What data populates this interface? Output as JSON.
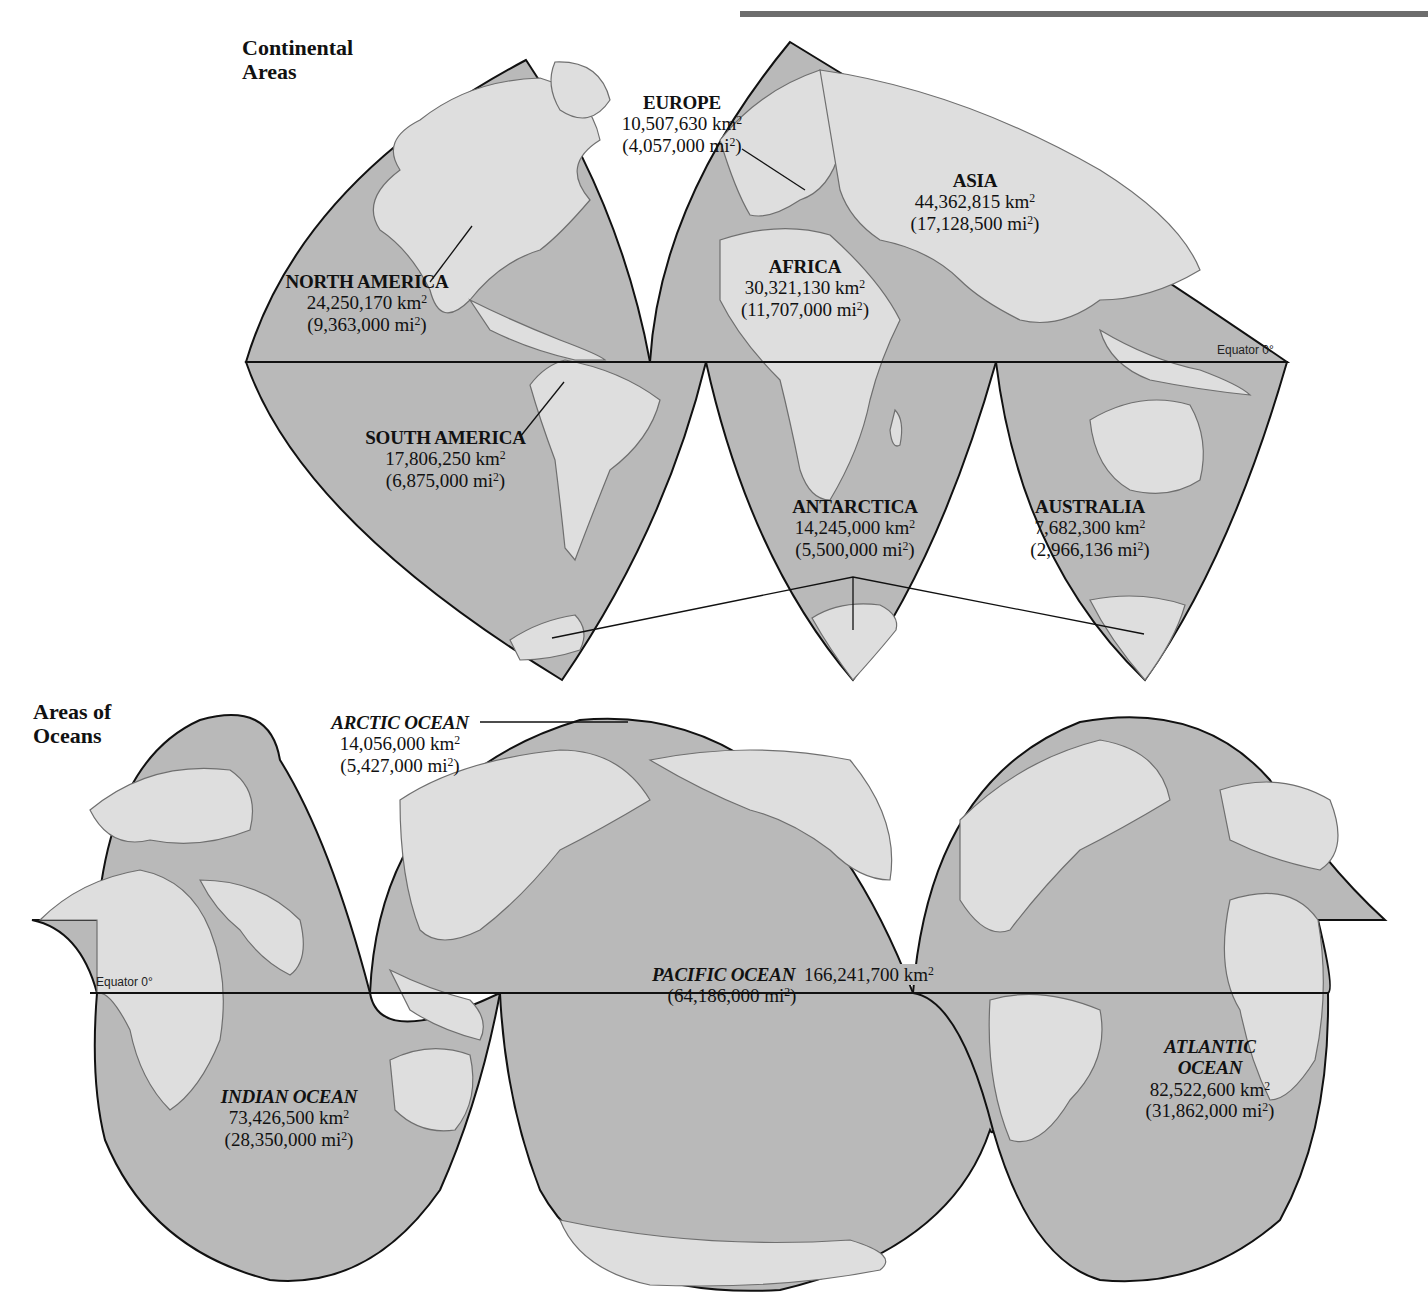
{
  "colors": {
    "ocean": "#b9b9b9",
    "land": "#dedede",
    "outline": "#111111",
    "coast": "#6f6f6f",
    "top_bar": "#6d6d6d"
  },
  "continental_map": {
    "title_line1": "Continental",
    "title_line2": "Areas",
    "equator_label": "Equator 0°",
    "continents": [
      {
        "name": "NORTH AMERICA",
        "km2": "24,250,170 km",
        "mi2": "(9,363,000 mi",
        "unit_sup": "2"
      },
      {
        "name": "SOUTH AMERICA",
        "km2": "17,806,250 km",
        "mi2": "(6,875,000 mi",
        "unit_sup": "2"
      },
      {
        "name": "EUROPE",
        "km2": "10,507,630 km",
        "mi2": "(4,057,000 mi",
        "unit_sup": "2"
      },
      {
        "name": "AFRICA",
        "km2": "30,321,130 km",
        "mi2": "(11,707,000 mi",
        "unit_sup": "2"
      },
      {
        "name": "ASIA",
        "km2": "44,362,815 km",
        "mi2": "(17,128,500 mi",
        "unit_sup": "2"
      },
      {
        "name": "ANTARCTICA",
        "km2": "14,245,000 km",
        "mi2": "(5,500,000 mi",
        "unit_sup": "2"
      },
      {
        "name": "AUSTRALIA",
        "km2": "7,682,300 km",
        "mi2": "(2,966,136 mi",
        "unit_sup": "2"
      }
    ]
  },
  "ocean_map": {
    "title_line1": "Areas of",
    "title_line2": "Oceans",
    "equator_label": "Equator 0°",
    "oceans": [
      {
        "name": "ARCTIC OCEAN",
        "km2": "14,056,000 km",
        "mi2": "(5,427,000 mi",
        "unit_sup": "2"
      },
      {
        "name": "PACIFIC OCEAN",
        "km2": "166,241,700 km",
        "mi2": "(64,186,000 mi",
        "unit_sup": "2"
      },
      {
        "name_line1": "ATLANTIC",
        "name_line2": "OCEAN",
        "km2": "82,522,600 km",
        "mi2": "(31,862,000 mi",
        "unit_sup": "2"
      },
      {
        "name": "INDIAN OCEAN",
        "km2": "73,426,500 km",
        "mi2": "(28,350,000 mi",
        "unit_sup": "2"
      }
    ]
  },
  "superscript_close": ")"
}
